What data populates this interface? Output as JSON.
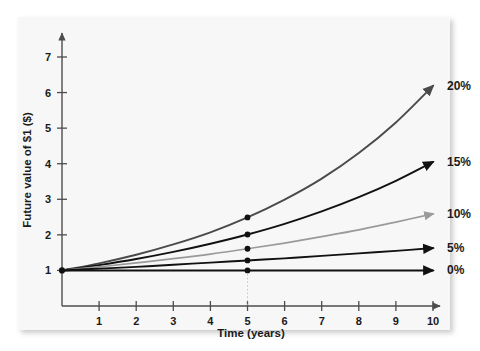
{
  "figure": {
    "panel_background": "#f7f7f7",
    "page_background": "#ffffff"
  },
  "chart_data": {
    "type": "line",
    "title": "",
    "subtitle": "",
    "xlabel": "Time (years)",
    "ylabel": "Future value of $1 ($)",
    "xlim": [
      0,
      10.6
    ],
    "ylim": [
      0,
      7.6
    ],
    "xticks": [
      1,
      2,
      3,
      4,
      5,
      6,
      7,
      8,
      9,
      10
    ],
    "xtick_labels": [
      "1",
      "2",
      "3",
      "4",
      "5",
      "6",
      "7",
      "8",
      "9",
      "10"
    ],
    "yticks": [
      1,
      2,
      3,
      4,
      5,
      6,
      7
    ],
    "ytick_labels": [
      "1",
      "2",
      "3",
      "4",
      "5",
      "6",
      "7"
    ],
    "grid": false,
    "legend_position": "right-of-line-ends",
    "x": [
      0,
      1,
      2,
      3,
      4,
      5,
      6,
      7,
      8,
      9,
      10
    ],
    "series": [
      {
        "name": "20%",
        "label": "20%",
        "color": "#4a4a4a",
        "rate": 0.2,
        "values": [
          1.0,
          1.2,
          1.44,
          1.73,
          2.07,
          2.49,
          2.99,
          3.58,
          4.3,
          5.16,
          6.19
        ],
        "marker_year": 5,
        "marker_value": 2.49,
        "end_value": 6.19
      },
      {
        "name": "15%",
        "label": "15%",
        "color": "#111111",
        "rate": 0.15,
        "values": [
          1.0,
          1.15,
          1.32,
          1.52,
          1.75,
          2.01,
          2.31,
          2.66,
          3.06,
          3.52,
          4.05
        ],
        "marker_year": 5,
        "marker_value": 2.01,
        "end_value": 4.05
      },
      {
        "name": "10%",
        "label": "10%",
        "color": "#9a9a9a",
        "rate": 0.1,
        "values": [
          1.0,
          1.1,
          1.21,
          1.33,
          1.46,
          1.61,
          1.77,
          1.95,
          2.14,
          2.36,
          2.59
        ],
        "marker_year": 5,
        "marker_value": 1.61,
        "end_value": 2.59
      },
      {
        "name": "5%",
        "label": "5%",
        "color": "#111111",
        "rate": 0.05,
        "values": [
          1.0,
          1.05,
          1.1,
          1.16,
          1.22,
          1.28,
          1.34,
          1.41,
          1.48,
          1.55,
          1.63
        ],
        "marker_year": 5,
        "marker_value": 1.28,
        "end_value": 1.63
      },
      {
        "name": "0%",
        "label": "0%",
        "color": "#111111",
        "rate": 0.0,
        "values": [
          1.0,
          1.0,
          1.0,
          1.0,
          1.0,
          1.0,
          1.0,
          1.0,
          1.0,
          1.0,
          1.0
        ],
        "marker_year": 5,
        "marker_value": 1.0,
        "end_value": 1.0
      }
    ]
  }
}
